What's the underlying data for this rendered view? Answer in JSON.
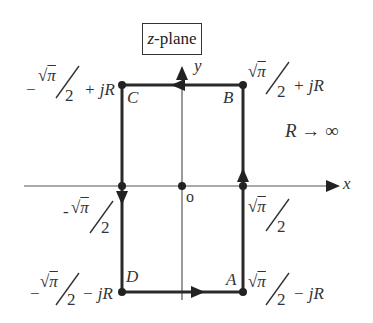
{
  "diagram": {
    "title": "z-plane",
    "title_italic_part": "z",
    "title_rest": "-plane",
    "axes": {
      "x_label": "x",
      "y_label": "y",
      "origin_label": "o"
    },
    "condition": "R → ∞",
    "points": [
      {
        "id": "A",
        "label": "A",
        "value": "√π/2 − jR"
      },
      {
        "id": "B",
        "label": "B",
        "value": "√π/2 + jR"
      },
      {
        "id": "C",
        "label": "C",
        "value": "−√π/2 + jR"
      },
      {
        "id": "D",
        "label": "D",
        "value": "−√π/2 − jR"
      }
    ],
    "axis_points": {
      "left": "-√π/2",
      "right": "√π/2"
    },
    "expr": {
      "sqrt": "√",
      "pi": "π",
      "two": "2",
      "minus": "−",
      "minus_dash": "-",
      "plus_jR": "+ jR",
      "minus_jR": "− jR"
    },
    "contour_direction": "counterclockwise: D→A→B→C→D",
    "colors": {
      "contour": "#2a2a2a",
      "axes": "#444444",
      "text": "#333333"
    }
  }
}
